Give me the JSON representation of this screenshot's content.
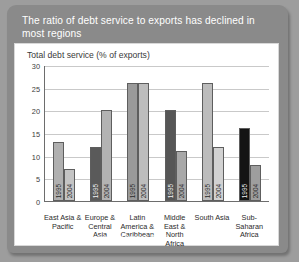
{
  "figure": {
    "title": "The ratio of debt service to exports has declined in most regions",
    "source": "Source: Global Development Finance 2006"
  },
  "chart_data": {
    "type": "bar",
    "title": "",
    "subtitle": "Total debt service (% of exports)",
    "xlabel": "",
    "ylabel": "Total debt service (% of exports)",
    "ylim": [
      0,
      30
    ],
    "yticks": [
      0,
      5,
      10,
      15,
      20,
      25,
      30
    ],
    "grid": true,
    "legend": "none",
    "categories": [
      "East Asia & Pacific",
      "Europe & Central Asia",
      "Latin America & Caribbean",
      "Middle East & North Africa",
      "South Asia",
      "Sub-Saharan Africa"
    ],
    "series": [
      {
        "name": "1995",
        "values": [
          13,
          12,
          26,
          20,
          26,
          16
        ]
      },
      {
        "name": "2004",
        "values": [
          7,
          20,
          26,
          11,
          12,
          8
        ]
      }
    ],
    "bar_colors": [
      [
        "#b0b0b0",
        "#c4c4c4"
      ],
      [
        "#5a5a5a",
        "#b3b3b3"
      ],
      [
        "#9a9a9a",
        "#bdbdbd"
      ],
      [
        "#565656",
        "#a8a8a8"
      ],
      [
        "#bcbcbc",
        "#d2d2d2"
      ],
      [
        "#141414",
        "#9e9e9e"
      ]
    ]
  },
  "colors": {
    "header_bg": "#8a8a8a",
    "page_bg": "#9d9d9d",
    "plot_bg": "#ffffff",
    "axis": "#6d6d6d",
    "grid": "#c9c9c9"
  }
}
